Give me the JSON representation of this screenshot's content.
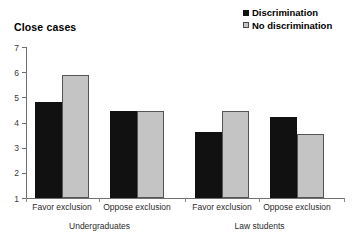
{
  "chart_data": {
    "type": "bar",
    "title": "Close cases",
    "xlabel": "",
    "ylabel": "",
    "ylim": [
      1,
      7
    ],
    "yticks": [
      1,
      2,
      3,
      4,
      5,
      6,
      7
    ],
    "grid": false,
    "legend_position": "top-right",
    "categories": [
      "Favor exclusion",
      "Oppose exclusion",
      "Favor exclusion",
      "Oppose exclusion"
    ],
    "group_labels": [
      "Undergraduates",
      "Law students"
    ],
    "groups": [
      {
        "label": "Undergraduates",
        "categories": [
          "Favor exclusion",
          "Oppose exclusion"
        ]
      },
      {
        "label": "Law students",
        "categories": [
          "Favor exclusion",
          "Oppose exclusion"
        ]
      }
    ],
    "series": [
      {
        "name": "Discrimination",
        "color": "#111111",
        "values": [
          4.82,
          4.47,
          3.62,
          4.21
        ]
      },
      {
        "name": "No discrimination",
        "color": "#c4c4c4",
        "values": [
          5.87,
          4.46,
          4.46,
          3.56
        ]
      }
    ]
  },
  "legend": {
    "items": [
      {
        "label": "Discrimination",
        "swatch": "filled-square-dark"
      },
      {
        "label": "No discrimination",
        "swatch": "filled-square-gray"
      }
    ]
  },
  "colors": {
    "series_dark": "#111111",
    "series_gray": "#c4c4c4",
    "axis": "#6f6f6f",
    "text": "#2b2b2b",
    "background": "#ffffff"
  }
}
